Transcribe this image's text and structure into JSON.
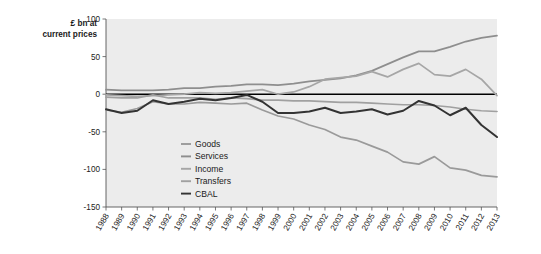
{
  "chart_data": {
    "type": "line",
    "title": "",
    "subtitle": "",
    "xlabel": "",
    "ylabel": "£ bn at current prices",
    "ylabel_line1": "£ bn at",
    "ylabel_line2": "current prices",
    "ylim": [
      -150,
      100
    ],
    "yticks": [
      100,
      50,
      0,
      -50,
      -100,
      -150
    ],
    "ytick_labels": [
      "100",
      "50",
      "0",
      "-50",
      "-100",
      "-150"
    ],
    "grid": false,
    "legend_position": "inside-bottom-center",
    "categories": [
      "1988",
      "1989",
      "1990",
      "1991",
      "1992",
      "1993",
      "1994",
      "1995",
      "1996",
      "1997",
      "1998",
      "1999",
      "2000",
      "2001",
      "2002",
      "2003",
      "2004",
      "2005",
      "2006",
      "2007",
      "2008",
      "2009",
      "2010",
      "2011",
      "2012",
      "2013"
    ],
    "x": [
      1988,
      1989,
      1990,
      1991,
      1992,
      1993,
      1994,
      1995,
      1996,
      1997,
      1998,
      1999,
      2000,
      2001,
      2002,
      2003,
      2004,
      2005,
      2006,
      2007,
      2008,
      2009,
      2010,
      2011,
      2012,
      2013
    ],
    "series": [
      {
        "name": "Goods",
        "color": "#9a9a9a",
        "width": 1.7,
        "values": [
          -21,
          -24,
          -19,
          -10,
          -13,
          -13,
          -11,
          -12,
          -13,
          -12,
          -21,
          -29,
          -33,
          -41,
          -47,
          -57,
          -61,
          -69,
          -77,
          -90,
          -93,
          -83,
          -98,
          -101,
          -108,
          -110
        ]
      },
      {
        "name": "Services",
        "color": "#8e8e8e",
        "width": 1.7,
        "values": [
          6,
          5,
          5,
          5,
          6,
          8,
          8,
          10,
          11,
          13,
          13,
          12,
          14,
          17,
          19,
          21,
          25,
          31,
          40,
          49,
          57,
          57,
          63,
          70,
          75,
          78
        ]
      },
      {
        "name": "Income",
        "color": "#a6a6a6",
        "width": 1.7,
        "values": [
          -1,
          -2,
          -3,
          -2,
          -1,
          0,
          2,
          1,
          2,
          4,
          6,
          0,
          3,
          10,
          20,
          22,
          24,
          30,
          23,
          33,
          41,
          26,
          24,
          33,
          20,
          -2
        ]
      },
      {
        "name": "Transfers",
        "color": "#a0a0a0",
        "width": 1.7,
        "values": [
          -4,
          -5,
          -5,
          -1,
          -5,
          -5,
          -5,
          -7,
          -5,
          -6,
          -8,
          -8,
          -9,
          -9,
          -10,
          -11,
          -11,
          -12,
          -13,
          -14,
          -14,
          -15,
          -17,
          -20,
          -22,
          -23
        ]
      },
      {
        "name": "CBAL",
        "color": "#333333",
        "width": 2.0,
        "values": [
          -20,
          -25,
          -22,
          -8,
          -13,
          -10,
          -6,
          -8,
          -5,
          -1,
          -10,
          -25,
          -25,
          -23,
          -18,
          -25,
          -23,
          -20,
          -27,
          -22,
          -9,
          -15,
          -28,
          -18,
          -41,
          -57
        ]
      }
    ],
    "legend": [
      {
        "label": "Goods",
        "color": "#9a9a9a"
      },
      {
        "label": "Services",
        "color": "#8e8e8e"
      },
      {
        "label": "Income",
        "color": "#a6a6a6"
      },
      {
        "label": "Transfers",
        "color": "#a0a0a0"
      },
      {
        "label": "CBAL",
        "color": "#333333"
      }
    ]
  },
  "figure": {
    "background": "#ffffff",
    "plot_background": "#ececec",
    "zero_line_color": "#000000"
  }
}
